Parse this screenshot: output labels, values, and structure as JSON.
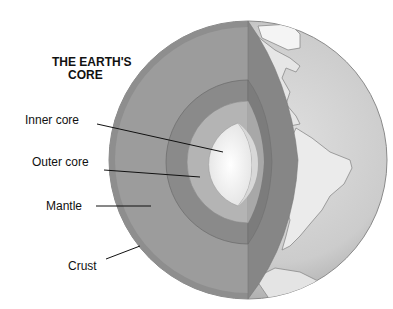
{
  "title": {
    "line1": "THE EARTH'S",
    "line2": "CORE"
  },
  "labels": [
    {
      "id": "inner-core",
      "text": "Inner core"
    },
    {
      "id": "outer-core",
      "text": "Outer core"
    },
    {
      "id": "mantle",
      "text": "Mantle"
    },
    {
      "id": "crust",
      "text": "Crust"
    }
  ],
  "colors": {
    "background": "#ffffff",
    "crust": "#8e8e8e",
    "mantle": "#9c9c9c",
    "mantle_cut_face": "#858585",
    "outer_core": "#8a8a8a",
    "outer_core_cut_face": "#7a7a7a",
    "inner_shell": "#b4b4b4",
    "inner_core": "#f2f2f2",
    "ocean": "#d2d2d2",
    "land": "#e8e8e8",
    "text": "#111111"
  }
}
